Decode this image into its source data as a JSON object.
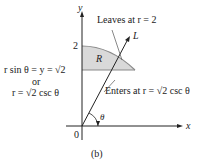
{
  "diagram": {
    "caption": "(b)",
    "axes": {
      "x_label": "x",
      "y_label": "y",
      "origin_label": "0"
    },
    "ticks": {
      "y_two": "2"
    },
    "region_label": "R",
    "line_label": "L",
    "angle_label": "θ",
    "annotations": {
      "leaves": "Leaves at r = 2",
      "enters": "Enters at r = √2 csc θ",
      "left_eq_1": "r sin θ = y = √2",
      "left_or": "or",
      "left_eq_2": "r = √2 csc θ"
    },
    "colors": {
      "region_fill": "#d9d9d9",
      "region_edge": "#8a8a8a",
      "axis": "#222222"
    }
  }
}
